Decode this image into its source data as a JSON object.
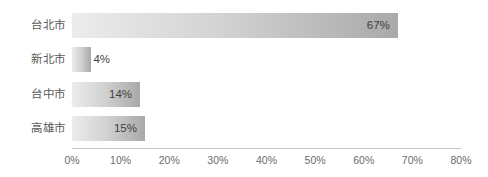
{
  "chart_data": {
    "type": "bar",
    "orientation": "horizontal",
    "title": "",
    "subtitle": "",
    "xlabel": "",
    "ylabel": "",
    "categories": [
      "台北市",
      "新北市",
      "台中市",
      "高雄市"
    ],
    "values": [
      67,
      4,
      14,
      15
    ],
    "value_labels": [
      "67%",
      "4%",
      "14%",
      "15%"
    ],
    "xlim": [
      0,
      80
    ],
    "x_tick_values": [
      0,
      10,
      20,
      30,
      40,
      50,
      60,
      70,
      80
    ],
    "x_tick_labels": [
      "0%",
      "10%",
      "20%",
      "30%",
      "40%",
      "50%",
      "60%",
      "70%",
      "80%"
    ],
    "grid": false,
    "legend": null,
    "bar_fill_start_color": "#ececec",
    "bar_fill_end_color": "#a9a9a9",
    "axis_line_color": "#c6c6c6",
    "label_text_color": "#5a5a5a",
    "value_text_color": "#3f3f3f"
  }
}
